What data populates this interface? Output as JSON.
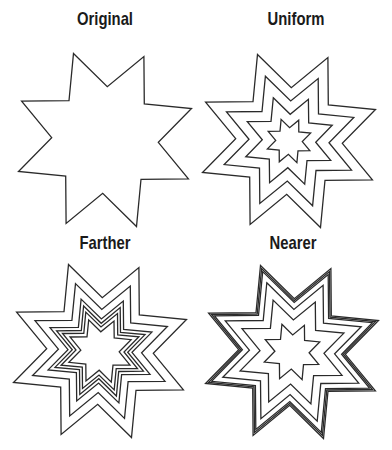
{
  "panels": [
    {
      "label": "Original",
      "label_pos": {
        "x": 45,
        "y": 8
      },
      "center": [
        105,
        140
      ],
      "outer_radius": 92,
      "scales": [
        1.0
      ]
    },
    {
      "label": "Uniform",
      "label_pos": {
        "x": 236,
        "y": 8
      },
      "center": [
        289,
        141
      ],
      "outer_radius": 92,
      "scales": [
        1.0,
        0.75,
        0.5,
        0.25
      ]
    },
    {
      "label": "Farther",
      "label_pos": {
        "x": 45,
        "y": 232
      },
      "center": [
        100,
        351
      ],
      "outer_radius": 92,
      "scales": [
        1.0,
        0.78,
        0.6,
        0.52,
        0.45,
        0.36
      ]
    },
    {
      "label": "Nearer",
      "label_pos": {
        "x": 233,
        "y": 232
      },
      "center": [
        292,
        352
      ],
      "outer_radius": 92,
      "scales": [
        1.0,
        0.965,
        0.93,
        0.8,
        0.6,
        0.32
      ]
    }
  ],
  "star": {
    "points": 8,
    "inner_ratio": 0.58,
    "rotation_deg": -110
  },
  "colors": {
    "stroke": "#2a2a2a",
    "background": "#ffffff",
    "text": "#1a1a1a"
  }
}
